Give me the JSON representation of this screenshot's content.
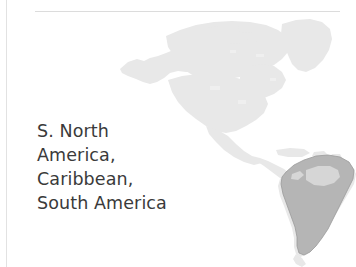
{
  "panel": {
    "name": "region-map-figure",
    "background_color": "#ffffff"
  },
  "divider": {
    "top_rule_color": "#dcdcdc",
    "left_rule_color": "#e2e2e2"
  },
  "caption": {
    "full_text": "S. North America, Caribbean, South America",
    "text_color": "#3a3a3a",
    "lines": [
      "S. North",
      "America,",
      "Caribbean,",
      "South America"
    ]
  },
  "map": {
    "icon_name": "americas-map",
    "base_landmass_color": "#e8e8e8",
    "highlight_color": "#b5b5b5",
    "highlight_outline_color": "#9a9a9a",
    "regions": [
      {
        "name": "North America",
        "highlighted": false
      },
      {
        "name": "Greenland",
        "highlighted": false
      },
      {
        "name": "Central America",
        "highlighted": false
      },
      {
        "name": "Caribbean",
        "highlighted": false
      },
      {
        "name": "South America",
        "highlighted": true
      }
    ]
  }
}
